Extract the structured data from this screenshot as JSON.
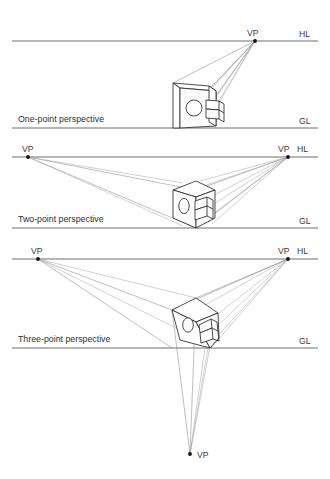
{
  "figure": {
    "background_color": "#ffffff",
    "line_color": "#6f6f6f",
    "ray_color": "#8a8a8a",
    "object_color": "#2a2a2a"
  },
  "panels": [
    {
      "id": "one-point",
      "caption": "One-point perspective",
      "horizon_label": "HL",
      "ground_label": "GL",
      "vanishing_points": [
        {
          "label": "VP",
          "x": 255,
          "y": 41,
          "label_x": 247,
          "label_y": 36
        }
      ],
      "horizon_line_y": 41,
      "ground_line_y": 128,
      "caption_x": 18,
      "caption_y": 122,
      "horizon_label_x": 299,
      "horizon_label_y": 37,
      "ground_label_x": 299,
      "ground_label_y": 124
    },
    {
      "id": "two-point",
      "caption": "Two-point perspective",
      "horizon_label": "HL",
      "ground_label": "GL",
      "vanishing_points": [
        {
          "label": "VP",
          "x": 28,
          "y": 157,
          "label_x": 22,
          "label_y": 152
        },
        {
          "label": "VP",
          "x": 288,
          "y": 157,
          "label_x": 278,
          "label_y": 152
        }
      ],
      "horizon_line_y": 157,
      "ground_line_y": 228,
      "caption_x": 18,
      "caption_y": 222,
      "horizon_label_x": 297,
      "horizon_label_y": 152,
      "ground_label_x": 299,
      "ground_label_y": 224
    },
    {
      "id": "three-point",
      "caption": "Three-point perspective",
      "horizon_label": "HL",
      "ground_label": "GL",
      "vanishing_points": [
        {
          "label": "VP",
          "x": 38,
          "y": 259,
          "label_x": 31,
          "label_y": 254
        },
        {
          "label": "VP",
          "x": 288,
          "y": 259,
          "label_x": 278,
          "label_y": 254
        },
        {
          "label": "VP",
          "x": 190,
          "y": 454,
          "label_x": 197,
          "label_y": 458
        }
      ],
      "horizon_line_y": 259,
      "ground_line_y": 348,
      "caption_x": 18,
      "caption_y": 342,
      "horizon_label_x": 297,
      "horizon_label_y": 254,
      "ground_label_x": 299,
      "ground_label_y": 344
    }
  ],
  "object_description": {
    "shape": "rectangular block with circular hole and stepped notch",
    "features": [
      "circle-hole",
      "stepped-notch",
      "top-face",
      "side-face",
      "front-face"
    ]
  }
}
